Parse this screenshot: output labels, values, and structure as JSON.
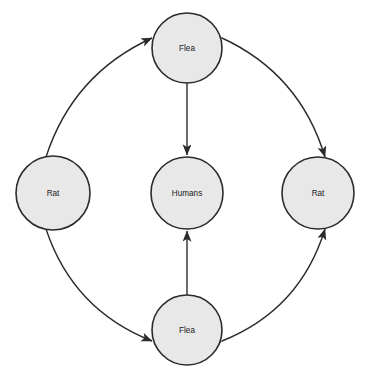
{
  "diagram": {
    "background_color": "#ffffff",
    "node_fill_color": "#e8e8e8",
    "node_stroke_color": "#2b2b2b",
    "edge_color": "#2b2b2b",
    "nodes": [
      {
        "id": "flea-top",
        "label": "Flea",
        "cx": 187,
        "cy": 48,
        "r": 35
      },
      {
        "id": "rat-left",
        "label": "Rat",
        "cx": 53,
        "cy": 193,
        "r": 37
      },
      {
        "id": "humans",
        "label": "Humans",
        "cx": 187,
        "cy": 193,
        "r": 36
      },
      {
        "id": "rat-right",
        "label": "Rat",
        "cx": 318,
        "cy": 193,
        "r": 36
      },
      {
        "id": "flea-bottom",
        "label": "Flea",
        "cx": 187,
        "cy": 330,
        "r": 35
      }
    ],
    "edges": [
      {
        "id": "edge-fleatop-ratleft",
        "from": "flea-top",
        "to": "rat-left",
        "style": "curved",
        "direction": "bidirectional"
      },
      {
        "id": "edge-fleatop-ratright",
        "from": "flea-top",
        "to": "rat-right",
        "style": "curved",
        "direction": "bidirectional"
      },
      {
        "id": "edge-fleabottom-ratleft",
        "from": "flea-bottom",
        "to": "rat-left",
        "style": "curved",
        "direction": "bidirectional"
      },
      {
        "id": "edge-fleabottom-ratright",
        "from": "flea-bottom",
        "to": "rat-right",
        "style": "curved",
        "direction": "bidirectional"
      },
      {
        "id": "edge-fleatop-humans",
        "from": "flea-top",
        "to": "humans",
        "style": "straight",
        "direction": "unidirectional"
      },
      {
        "id": "edge-fleabottom-humans",
        "from": "flea-bottom",
        "to": "humans",
        "style": "straight",
        "direction": "unidirectional"
      }
    ]
  }
}
